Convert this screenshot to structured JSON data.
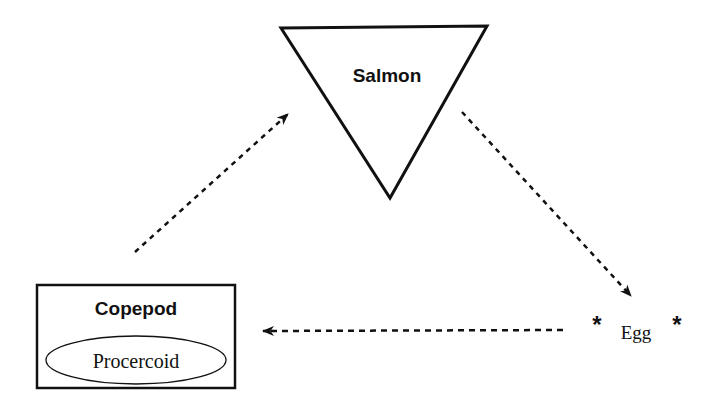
{
  "diagram": {
    "nodes": {
      "salmon": {
        "label": "Salmon",
        "shape": "inverted-triangle"
      },
      "copepod": {
        "label": "Copepod",
        "shape": "rectangle",
        "inner": {
          "label": "Procercoid",
          "shape": "ellipse"
        }
      },
      "egg": {
        "label": "Egg",
        "marker": "*",
        "shape": "none"
      }
    },
    "edges": [
      {
        "from": "copepod",
        "to": "salmon",
        "style": "dashed-arrow"
      },
      {
        "from": "salmon",
        "to": "egg",
        "style": "dashed-arrow"
      },
      {
        "from": "egg",
        "to": "copepod",
        "style": "dashed-arrow"
      }
    ],
    "colors": {
      "stroke": "#111111",
      "background": "#ffffff"
    }
  }
}
